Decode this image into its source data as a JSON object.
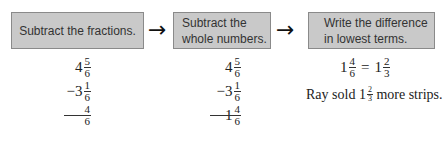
{
  "steps": [
    {
      "label": "Subtract the fractions."
    },
    {
      "label_line1": "Subtract the",
      "label_line2": "whole numbers."
    },
    {
      "label_line1": "Write the difference",
      "label_line2": "in lowest terms."
    }
  ],
  "arrow_glyph": "→",
  "column1": {
    "minuend": {
      "whole": "4",
      "num": "5",
      "den": "6"
    },
    "subtrahend": {
      "sign": "−",
      "whole": "3",
      "num": "1",
      "den": "6"
    },
    "result": {
      "whole": "",
      "num": "4",
      "den": "6"
    }
  },
  "column2": {
    "minuend": {
      "whole": "4",
      "num": "5",
      "den": "6"
    },
    "subtrahend": {
      "sign": "−",
      "whole": "3",
      "num": "1",
      "den": "6"
    },
    "result": {
      "whole": "1",
      "num": "4",
      "den": "6"
    }
  },
  "column3": {
    "equation": {
      "left": {
        "whole": "1",
        "num": "4",
        "den": "6"
      },
      "equals": "=",
      "right": {
        "whole": "1",
        "num": "2",
        "den": "3"
      }
    },
    "sentence": {
      "prefix": "Ray sold ",
      "whole": "1",
      "num": "2",
      "den": "3",
      "suffix": " more strips."
    }
  }
}
